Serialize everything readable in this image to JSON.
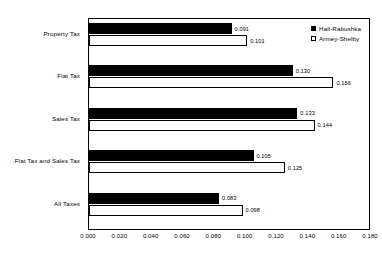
{
  "chart_data": {
    "type": "bar",
    "orientation": "horizontal",
    "title": "",
    "subtitle": "",
    "xlabel": "",
    "ylabel": "",
    "categories": [
      "Property  Tax",
      "Flat Tax",
      "Sales Tax",
      "Flat Tax and Sales Tax",
      "All Taxes"
    ],
    "series": [
      {
        "name": "Hall-Rabushka",
        "color": "#000000",
        "fill": "solid",
        "values": [
          0.091,
          0.13,
          0.133,
          0.105,
          0.083
        ],
        "labels": [
          "0.091",
          "0.130",
          "0.133",
          "0.105",
          "0.083"
        ]
      },
      {
        "name": "Armey-Shelby",
        "color": "#ffffff",
        "fill": "open",
        "values": [
          0.101,
          0.156,
          0.144,
          0.125,
          0.098
        ],
        "labels": [
          "0.101",
          "0.156",
          "0.144",
          "0.125",
          "0.098"
        ]
      }
    ],
    "xlim": [
      0.0,
      0.18
    ],
    "xticks": [
      0.0,
      0.02,
      0.04,
      0.06,
      0.08,
      0.1,
      0.12,
      0.14,
      0.16,
      0.18
    ],
    "xtick_labels": [
      "0.000",
      "0.020",
      "0.040",
      "0.060",
      "0.080",
      "0.100",
      "0.120",
      "0.140",
      "0.160",
      "0.180"
    ],
    "grid": false,
    "legend_position": "top-right",
    "plot_border": true
  }
}
